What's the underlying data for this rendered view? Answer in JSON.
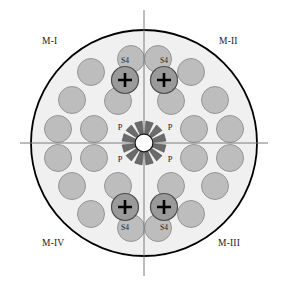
{
  "figure": {
    "type": "technical-cross-section-diagram"
  },
  "colors": {
    "background": "#ffffff",
    "plate_fill": "#f0f0f0",
    "plate_stroke": "#000000",
    "rod_fill": "#bdbdbd",
    "rod_stroke": "#8f8f8f",
    "control_rod_fill": "#9a9a9a",
    "control_rod_stroke": "#4d4d4d",
    "spoke_fill": "#6b6b6b",
    "spoke_stroke": "#4d4d4d",
    "center_hole_fill": "#ffffff",
    "center_hole_stroke": "#1a1a1a",
    "axis_line": "#7a7a7a",
    "text": "#1a1a1a",
    "plus_mark": "#000000"
  },
  "quadrant_labels": [
    {
      "id": "m1",
      "text": "M-I",
      "position": "top-left"
    },
    {
      "id": "m2",
      "text": "M-II",
      "position": "top-right"
    },
    {
      "id": "m3",
      "text": "M-III",
      "position": "bottom-right"
    },
    {
      "id": "m4",
      "text": "M-IV",
      "position": "bottom-left"
    }
  ],
  "plate": {
    "center_x": 144,
    "center_y": 143,
    "radius": 113,
    "stroke_width": 1.8
  },
  "axes": {
    "horizontal": {
      "x1": 20,
      "y1": 143,
      "x2": 268,
      "y2": 143
    },
    "vertical": {
      "x1": 144,
      "y1": 10,
      "x2": 144,
      "y2": 276
    },
    "stroke_width": 1
  },
  "center_hub": {
    "hole_radius": 9,
    "spoke_count": 12,
    "spoke_inner_radius": 10,
    "spoke_outer_radius": 22,
    "spoke_half_angle_deg": 10
  },
  "rods": {
    "radius": 13.5,
    "plain_count": 24,
    "control_count": 4,
    "total_count": 28,
    "plain_positions": [
      {
        "x": 91,
        "y": 72
      },
      {
        "x": 191,
        "y": 72
      },
      {
        "x": 72,
        "y": 100
      },
      {
        "x": 118,
        "y": 101
      },
      {
        "x": 171,
        "y": 101
      },
      {
        "x": 215,
        "y": 100
      },
      {
        "x": 58,
        "y": 129
      },
      {
        "x": 94,
        "y": 129
      },
      {
        "x": 194,
        "y": 129
      },
      {
        "x": 230,
        "y": 129
      },
      {
        "x": 58,
        "y": 158
      },
      {
        "x": 94,
        "y": 158
      },
      {
        "x": 194,
        "y": 158
      },
      {
        "x": 230,
        "y": 158
      },
      {
        "x": 72,
        "y": 186
      },
      {
        "x": 118,
        "y": 186
      },
      {
        "x": 171,
        "y": 186
      },
      {
        "x": 215,
        "y": 186
      },
      {
        "x": 91,
        "y": 214
      },
      {
        "x": 191,
        "y": 214
      },
      {
        "x": 131,
        "y": 59
      },
      {
        "x": 158,
        "y": 59
      },
      {
        "x": 131,
        "y": 228
      },
      {
        "x": 158,
        "y": 228
      }
    ],
    "control_positions": [
      {
        "x": 125,
        "y": 80,
        "label": "S4",
        "label_side": "above"
      },
      {
        "x": 164,
        "y": 80,
        "label": "S4",
        "label_side": "above"
      },
      {
        "x": 125,
        "y": 207,
        "label": "S4",
        "label_side": "below"
      },
      {
        "x": 164,
        "y": 207,
        "label": "S4",
        "label_side": "below"
      }
    ]
  },
  "markers": {
    "s4_label": "S4",
    "p_label": "P",
    "s4_font_size": 7.5,
    "p_font_size": 8.5,
    "p_positions": [
      {
        "x": 120,
        "y": 130,
        "anchor": "middle"
      },
      {
        "x": 170,
        "y": 130,
        "anchor": "middle"
      },
      {
        "x": 120,
        "y": 162,
        "anchor": "middle"
      },
      {
        "x": 170,
        "y": 162,
        "anchor": "middle"
      }
    ]
  },
  "plus_mark": {
    "arm_length": 7,
    "stroke_width": 2.6
  }
}
